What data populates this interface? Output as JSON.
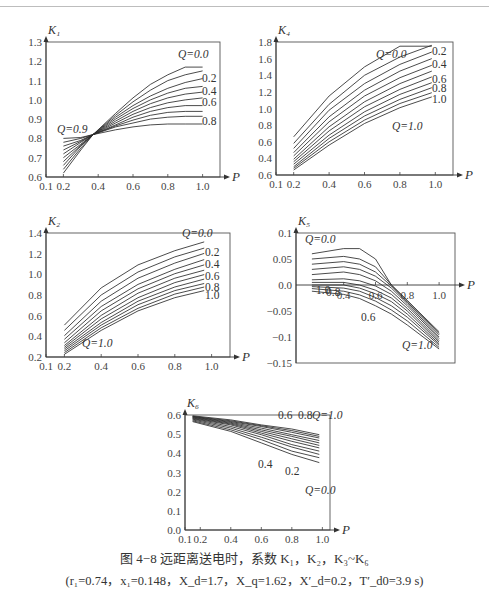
{
  "figure": {
    "caption_line1": "图 4−8  远距离送电时，系数 K₁，K₂，K₃~K₆",
    "caption_line2": "(r₁=0.74，x₁=0.148，X_d=1.7，X_q=1.62，X′_d=0.2，T′_d0=3.9 s)"
  },
  "chart_data": [
    {
      "id": "K1",
      "type": "line",
      "ylabel": "K₁",
      "xlabel": "P",
      "xticks": [
        "0.1",
        "0.2",
        "0.4",
        "0.6",
        "0.8",
        "1.0"
      ],
      "yticks": [
        "0.6",
        "0.7",
        "0.8",
        "0.9",
        "1.0",
        "1.1",
        "1.2",
        "1.3"
      ],
      "xlim": [
        0.1,
        1.1
      ],
      "ylim": [
        0.6,
        1.3
      ],
      "annotations": [
        "Q=0.0",
        "0.2",
        "0.4",
        "0.6",
        "0.8",
        "Q=0.9"
      ],
      "x": [
        0.2,
        0.3,
        0.37,
        0.5,
        0.6,
        0.7,
        0.8,
        0.9,
        1.0
      ],
      "series": [
        {
          "name": "Q=0.0",
          "values": [
            0.62,
            0.74,
            0.82,
            0.93,
            1.01,
            1.08,
            1.13,
            1.17,
            1.17
          ]
        },
        {
          "name": "Q=0.1",
          "values": [
            0.64,
            0.75,
            0.82,
            0.92,
            0.99,
            1.05,
            1.1,
            1.13,
            1.15
          ]
        },
        {
          "name": "Q=0.2",
          "values": [
            0.66,
            0.76,
            0.82,
            0.91,
            0.97,
            1.02,
            1.06,
            1.09,
            1.11
          ]
        },
        {
          "name": "Q=0.3",
          "values": [
            0.68,
            0.765,
            0.82,
            0.9,
            0.955,
            1.0,
            1.035,
            1.06,
            1.07
          ]
        },
        {
          "name": "Q=0.4",
          "values": [
            0.7,
            0.77,
            0.82,
            0.89,
            0.94,
            0.98,
            1.01,
            1.03,
            1.04
          ]
        },
        {
          "name": "Q=0.5",
          "values": [
            0.72,
            0.78,
            0.82,
            0.88,
            0.925,
            0.96,
            0.985,
            1.0,
            1.01
          ]
        },
        {
          "name": "Q=0.6",
          "values": [
            0.74,
            0.785,
            0.82,
            0.87,
            0.91,
            0.94,
            0.96,
            0.97,
            0.97
          ]
        },
        {
          "name": "Q=0.7",
          "values": [
            0.76,
            0.79,
            0.82,
            0.865,
            0.895,
            0.92,
            0.935,
            0.94,
            0.94
          ]
        },
        {
          "name": "Q=0.8",
          "values": [
            0.78,
            0.8,
            0.82,
            0.86,
            0.88,
            0.9,
            0.91,
            0.915,
            0.915
          ]
        },
        {
          "name": "Q=0.9",
          "values": [
            0.8,
            0.805,
            0.82,
            0.845,
            0.86,
            0.87,
            0.875,
            0.875,
            0.875
          ]
        }
      ]
    },
    {
      "id": "K4",
      "type": "line",
      "ylabel": "K₄",
      "xlabel": "P",
      "xticks": [
        "0.1",
        "0.2",
        "0.4",
        "0.6",
        "0.8",
        "1.0"
      ],
      "yticks": [
        "0.6",
        "0.4",
        "0.6",
        "0.8",
        "1.0",
        "1.2",
        "1.4",
        "1.6",
        "1.8"
      ],
      "xlim": [
        0.1,
        1.1
      ],
      "ylim": [
        0.2,
        1.8
      ],
      "annotations": [
        "Q=0.0",
        "0.2",
        "0.4",
        "0.6",
        "0.8",
        "1.0",
        "Q=1.0"
      ],
      "x": [
        0.2,
        0.4,
        0.6,
        0.8,
        0.98
      ],
      "series": [
        {
          "name": "Q=0.0",
          "values": [
            0.66,
            1.15,
            1.5,
            1.75,
            1.75
          ]
        },
        {
          "name": "Q=0.1",
          "values": [
            0.58,
            1.05,
            1.4,
            1.62,
            1.76
          ]
        },
        {
          "name": "Q=0.2",
          "values": [
            0.52,
            0.98,
            1.3,
            1.53,
            1.68
          ]
        },
        {
          "name": "Q=0.3",
          "values": [
            0.47,
            0.9,
            1.22,
            1.45,
            1.6
          ]
        },
        {
          "name": "Q=0.4",
          "values": [
            0.43,
            0.84,
            1.15,
            1.37,
            1.52
          ]
        },
        {
          "name": "Q=0.5",
          "values": [
            0.39,
            0.78,
            1.08,
            1.3,
            1.45
          ]
        },
        {
          "name": "Q=0.6",
          "values": [
            0.36,
            0.73,
            1.02,
            1.23,
            1.38
          ]
        },
        {
          "name": "Q=0.7",
          "values": [
            0.33,
            0.68,
            0.96,
            1.17,
            1.31
          ]
        },
        {
          "name": "Q=0.8",
          "values": [
            0.3,
            0.64,
            0.91,
            1.11,
            1.25
          ]
        },
        {
          "name": "Q=0.9",
          "values": [
            0.28,
            0.6,
            0.86,
            1.06,
            1.19
          ]
        },
        {
          "name": "Q=1.0",
          "values": [
            0.26,
            0.56,
            0.82,
            1.01,
            1.14
          ]
        }
      ]
    },
    {
      "id": "K2",
      "type": "line",
      "ylabel": "K₂",
      "xlabel": "P",
      "xticks": [
        "0.1",
        "0.2",
        "0.4",
        "0.6",
        "0.8",
        "1.0"
      ],
      "yticks": [
        "0.2",
        "0.4",
        "0.6",
        "0.8",
        "1.0",
        "1.2",
        "1.4"
      ],
      "xlim": [
        0.1,
        1.1
      ],
      "ylim": [
        0.0,
        1.4
      ],
      "annotations": [
        "Q=0.0",
        "0.2",
        "0.4",
        "0.6",
        "0.8",
        "1.0",
        "Q=1.0"
      ],
      "x": [
        0.2,
        0.4,
        0.6,
        0.8,
        0.96
      ],
      "series": [
        {
          "name": "Q=0.0",
          "values": [
            0.36,
            0.78,
            1.04,
            1.2,
            1.3
          ]
        },
        {
          "name": "Q=0.1",
          "values": [
            0.3,
            0.7,
            0.96,
            1.13,
            1.23
          ]
        },
        {
          "name": "Q=0.2",
          "values": [
            0.24,
            0.63,
            0.89,
            1.06,
            1.17
          ]
        },
        {
          "name": "Q=0.3",
          "values": [
            0.2,
            0.57,
            0.82,
            0.99,
            1.1
          ]
        },
        {
          "name": "Q=0.4",
          "values": [
            0.16,
            0.52,
            0.77,
            0.94,
            1.04
          ]
        },
        {
          "name": "Q=0.5",
          "values": [
            0.13,
            0.47,
            0.72,
            0.89,
            0.98
          ]
        },
        {
          "name": "Q=0.6",
          "values": [
            0.11,
            0.43,
            0.67,
            0.84,
            0.93
          ]
        },
        {
          "name": "Q=0.7",
          "values": [
            0.09,
            0.39,
            0.63,
            0.79,
            0.88
          ]
        },
        {
          "name": "Q=0.8",
          "values": [
            0.07,
            0.36,
            0.59,
            0.75,
            0.83
          ]
        },
        {
          "name": "Q=0.9",
          "values": [
            0.05,
            0.33,
            0.55,
            0.71,
            0.79
          ]
        },
        {
          "name": "Q=1.0",
          "values": [
            0.03,
            0.3,
            0.52,
            0.67,
            0.75
          ]
        }
      ]
    },
    {
      "id": "K5",
      "type": "line",
      "ylabel": "K₅",
      "xlabel": "P",
      "xticks": [
        "0.4",
        "0.6",
        "0.8",
        "1.0"
      ],
      "yticks": [
        "0.1",
        "0.05",
        "0.0",
        "−0.05",
        "−0.1",
        "−0.15"
      ],
      "xlim": [
        0.1,
        1.1
      ],
      "ylim": [
        -0.15,
        0.1
      ],
      "annotations": [
        "Q=0.0",
        "1.0",
        "0.8",
        "0.6",
        "Q=1.0"
      ],
      "x": [
        0.2,
        0.4,
        0.5,
        0.6,
        0.7,
        0.8,
        1.0
      ],
      "series": [
        {
          "name": "Q=0.0",
          "values": [
            0.06,
            0.07,
            0.07,
            0.05,
            0.0,
            -0.03,
            -0.09
          ]
        },
        {
          "name": "Q=0.1",
          "values": [
            0.05,
            0.055,
            0.05,
            0.035,
            0.0,
            -0.03,
            -0.093
          ]
        },
        {
          "name": "Q=0.2",
          "values": [
            0.04,
            0.045,
            0.04,
            0.025,
            -0.002,
            -0.033,
            -0.096
          ]
        },
        {
          "name": "Q=0.3",
          "values": [
            0.03,
            0.035,
            0.03,
            0.017,
            -0.006,
            -0.036,
            -0.1
          ]
        },
        {
          "name": "Q=0.4",
          "values": [
            0.02,
            0.025,
            0.02,
            0.008,
            -0.012,
            -0.04,
            -0.103
          ]
        },
        {
          "name": "Q=0.5",
          "values": [
            0.01,
            0.012,
            0.008,
            -0.002,
            -0.018,
            -0.045,
            -0.107
          ]
        },
        {
          "name": "Q=0.6",
          "values": [
            0.005,
            0.005,
            0.0,
            -0.01,
            -0.025,
            -0.05,
            -0.11
          ]
        },
        {
          "name": "Q=0.7",
          "values": [
            0.0,
            0.0,
            -0.006,
            -0.017,
            -0.032,
            -0.056,
            -0.113
          ]
        },
        {
          "name": "Q=0.8",
          "values": [
            -0.003,
            -0.006,
            -0.012,
            -0.024,
            -0.04,
            -0.062,
            -0.116
          ]
        },
        {
          "name": "Q=0.9",
          "values": [
            -0.007,
            -0.012,
            -0.019,
            -0.031,
            -0.048,
            -0.069,
            -0.12
          ]
        },
        {
          "name": "Q=1.0",
          "values": [
            -0.012,
            -0.018,
            -0.026,
            -0.04,
            -0.056,
            -0.077,
            -0.123
          ]
        }
      ]
    },
    {
      "id": "K6",
      "type": "line",
      "ylabel": "K₆",
      "xlabel": "P",
      "xticks": [
        "0.1",
        "0.2",
        "0.4",
        "0.6",
        "0.8",
        "1.0"
      ],
      "yticks": [
        "0.0",
        "0.1",
        "0.2",
        "0.3",
        "0.4",
        "0.5",
        "0.6"
      ],
      "xlim": [
        0.1,
        1.05
      ],
      "ylim": [
        0.0,
        0.7
      ],
      "annotations": [
        "0.6",
        "0.8",
        "Q=1.0",
        "0.4",
        "0.2",
        "Q=0.0"
      ],
      "x": [
        0.15,
        0.4,
        0.6,
        0.8,
        0.98
      ],
      "series": [
        {
          "name": "Q=0.0",
          "values": [
            0.66,
            0.6,
            0.53,
            0.46,
            0.41
          ]
        },
        {
          "name": "Q=0.1",
          "values": [
            0.665,
            0.61,
            0.55,
            0.48,
            0.44
          ]
        },
        {
          "name": "Q=0.2",
          "values": [
            0.67,
            0.62,
            0.565,
            0.505,
            0.46
          ]
        },
        {
          "name": "Q=0.3",
          "values": [
            0.675,
            0.63,
            0.58,
            0.52,
            0.48
          ]
        },
        {
          "name": "Q=0.4",
          "values": [
            0.678,
            0.64,
            0.59,
            0.54,
            0.5
          ]
        },
        {
          "name": "Q=0.5",
          "values": [
            0.682,
            0.645,
            0.6,
            0.555,
            0.515
          ]
        },
        {
          "name": "Q=0.6",
          "values": [
            0.685,
            0.65,
            0.61,
            0.57,
            0.53
          ]
        },
        {
          "name": "Q=0.7",
          "values": [
            0.688,
            0.655,
            0.62,
            0.58,
            0.545
          ]
        },
        {
          "name": "Q=0.8",
          "values": [
            0.69,
            0.66,
            0.63,
            0.595,
            0.56
          ]
        },
        {
          "name": "Q=0.9",
          "values": [
            0.692,
            0.665,
            0.635,
            0.605,
            0.57
          ]
        },
        {
          "name": "Q=1.0",
          "values": [
            0.695,
            0.67,
            0.64,
            0.615,
            0.58
          ]
        }
      ]
    }
  ]
}
